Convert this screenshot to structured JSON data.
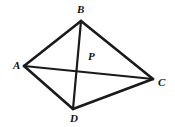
{
  "figure": {
    "background_color": "#ffffff",
    "stroke_color": "#1a1a1a",
    "width": 175,
    "height": 127,
    "points": {
      "A": {
        "label": "A",
        "x": 24,
        "y": 66,
        "label_x": 13,
        "label_y": 60
      },
      "B": {
        "label": "B",
        "x": 81,
        "y": 21,
        "label_x": 77,
        "label_y": 4
      },
      "C": {
        "label": "C",
        "x": 153,
        "y": 79,
        "label_x": 158,
        "label_y": 77
      },
      "D": {
        "label": "D",
        "x": 73,
        "y": 109,
        "label_x": 70,
        "label_y": 113
      },
      "P": {
        "label": "P",
        "x": 84,
        "y": 66,
        "label_x": 88,
        "label_y": 51
      }
    },
    "segments": [
      {
        "name": "AB",
        "from": "A",
        "to": "B",
        "x1": 24,
        "y1": 66,
        "x2": 81,
        "y2": 21
      },
      {
        "name": "BC",
        "from": "B",
        "to": "C",
        "x1": 81,
        "y1": 21,
        "x2": 153,
        "y2": 79
      },
      {
        "name": "CD",
        "from": "C",
        "to": "D",
        "x1": 153,
        "y1": 79,
        "x2": 73,
        "y2": 109
      },
      {
        "name": "DA",
        "from": "D",
        "to": "A",
        "x1": 73,
        "y1": 109,
        "x2": 24,
        "y2": 66
      },
      {
        "name": "AC",
        "from": "A",
        "to": "C",
        "x1": 24,
        "y1": 66,
        "x2": 153,
        "y2": 79
      },
      {
        "name": "BD",
        "from": "B",
        "to": "D",
        "x1": 81,
        "y1": 21,
        "x2": 73,
        "y2": 109
      }
    ]
  }
}
